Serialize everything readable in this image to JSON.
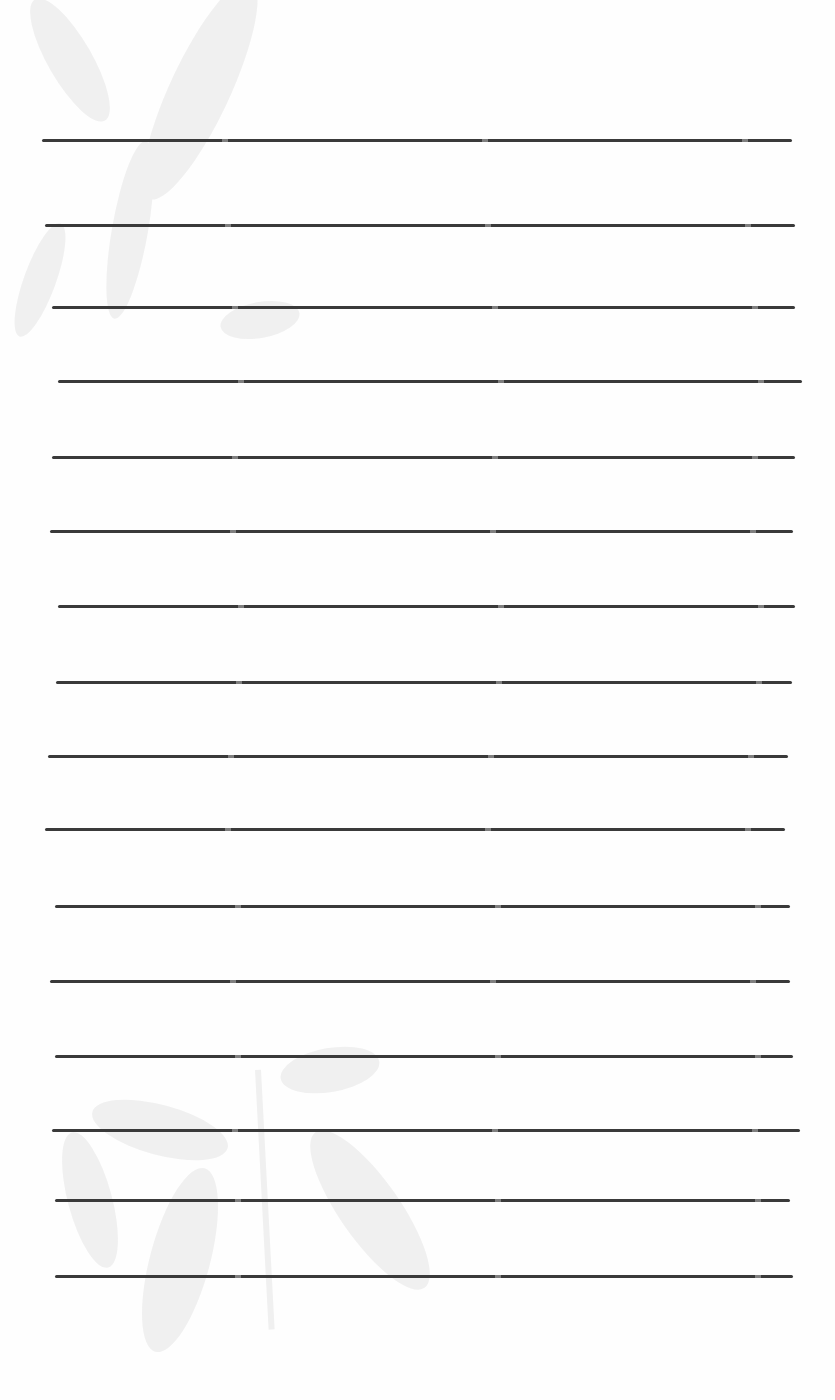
{
  "page": {
    "type": "blank lined paper",
    "background_color": "#fefefe",
    "line_color": "#3a3a3a",
    "watermark": "faint bamboo leaves",
    "lines": [
      {
        "y": 140,
        "x1": 42,
        "x2": 792
      },
      {
        "y": 225,
        "x1": 45,
        "x2": 795
      },
      {
        "y": 307,
        "x1": 52,
        "x2": 795
      },
      {
        "y": 381,
        "x1": 58,
        "x2": 802
      },
      {
        "y": 457,
        "x1": 52,
        "x2": 795
      },
      {
        "y": 531,
        "x1": 50,
        "x2": 793
      },
      {
        "y": 606,
        "x1": 58,
        "x2": 795
      },
      {
        "y": 682,
        "x1": 56,
        "x2": 792
      },
      {
        "y": 756,
        "x1": 48,
        "x2": 788
      },
      {
        "y": 829,
        "x1": 45,
        "x2": 785
      },
      {
        "y": 906,
        "x1": 55,
        "x2": 790
      },
      {
        "y": 981,
        "x1": 50,
        "x2": 790
      },
      {
        "y": 1056,
        "x1": 55,
        "x2": 793
      },
      {
        "y": 1130,
        "x1": 52,
        "x2": 800
      },
      {
        "y": 1200,
        "x1": 55,
        "x2": 790
      },
      {
        "y": 1276,
        "x1": 55,
        "x2": 793
      }
    ]
  }
}
